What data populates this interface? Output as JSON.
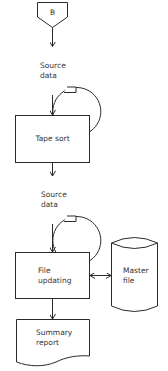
{
  "diagram": {
    "type": "flowchart",
    "nodes": [
      {
        "id": "connector-b",
        "shape": "off-page-connector",
        "label": "B"
      },
      {
        "id": "source-data-1",
        "shape": "magnetic-tape",
        "line1": "Source",
        "line2": "data"
      },
      {
        "id": "tape-sort",
        "shape": "process",
        "label": "Tape sort"
      },
      {
        "id": "source-data-2",
        "shape": "magnetic-tape",
        "line1": "Source",
        "line2": "data"
      },
      {
        "id": "file-updating",
        "shape": "process",
        "line1": "File",
        "line2": "updating"
      },
      {
        "id": "master-file",
        "shape": "direct-access-storage",
        "line1": "Master",
        "line2": "file"
      },
      {
        "id": "summary-report",
        "shape": "document",
        "line1": "Summary",
        "line2": "report"
      }
    ],
    "edges": [
      {
        "from": "connector-b",
        "to": "source-data-1",
        "direction": "forward"
      },
      {
        "from": "source-data-1",
        "to": "tape-sort",
        "direction": "forward"
      },
      {
        "from": "tape-sort",
        "to": "source-data-2",
        "direction": "forward"
      },
      {
        "from": "source-data-2",
        "to": "file-updating",
        "direction": "forward"
      },
      {
        "from": "file-updating",
        "to": "master-file",
        "direction": "bidirectional"
      },
      {
        "from": "file-updating",
        "to": "summary-report",
        "direction": "forward"
      }
    ],
    "colors": {
      "stroke": "#2a2a2a",
      "text": "#333333",
      "background": "#ffffff"
    }
  }
}
